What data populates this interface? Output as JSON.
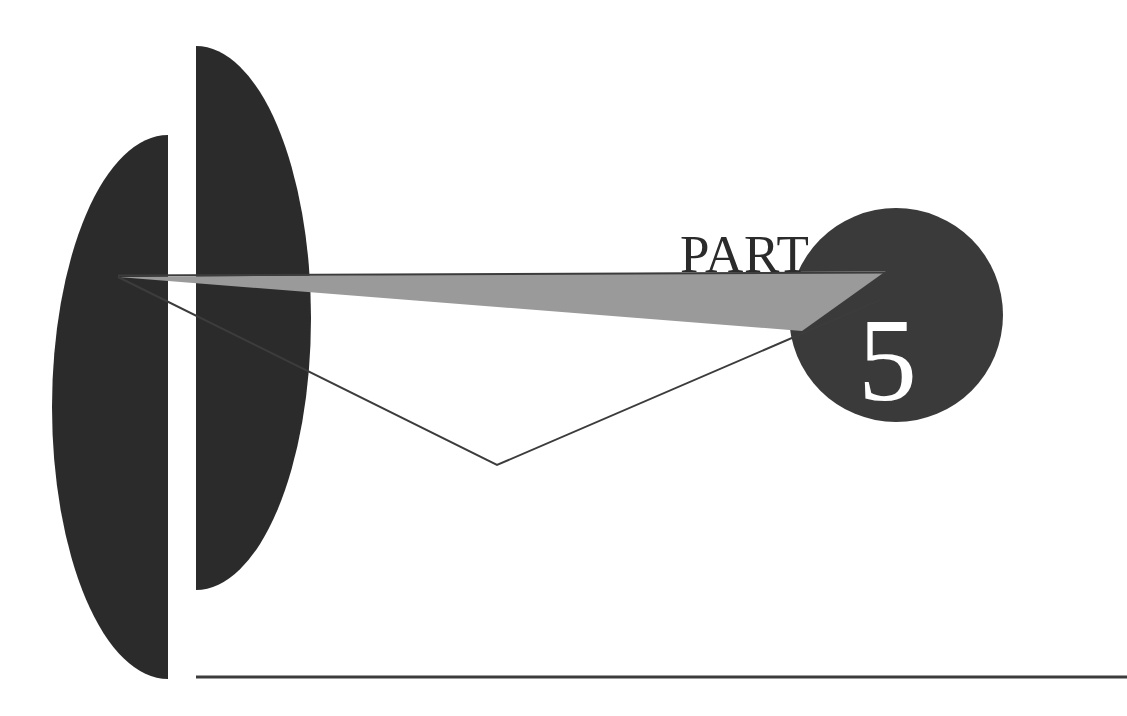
{
  "page": {
    "kind": "book-part-divider",
    "background_color": "#ffffff"
  },
  "divider": {
    "label": "PART",
    "number": "5",
    "label_color": "#2b2b2b",
    "number_color": "#ffffff"
  },
  "shapes": {
    "left_half_ellipse": {
      "name": "left-half-ellipse",
      "fill": "#2b2b2b"
    },
    "right_half_ellipse": {
      "name": "right-half-ellipse",
      "fill": "#2b2b2b"
    },
    "circle_badge": {
      "name": "circle-badge",
      "fill": "#3a3a3a"
    },
    "wedge_triangle": {
      "name": "gray-wedge",
      "fill": "#9a9a9a"
    },
    "rules": {
      "name": "hairline-rules",
      "stroke": "#3c3c3c"
    }
  }
}
